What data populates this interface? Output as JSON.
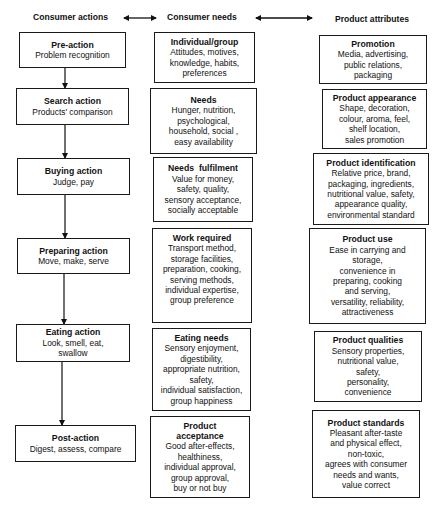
{
  "headers": {
    "consumer_actions": "Consumer actions",
    "consumer_needs": "Consumer needs",
    "product_attributes": "Product attributes"
  },
  "consumer_actions": [
    {
      "title": "Pre-action",
      "body": "Problem recognition"
    },
    {
      "title": "Search action",
      "body": "Products' comparison"
    },
    {
      "title": "Buying action",
      "body": "Judge, pay"
    },
    {
      "title": "Preparing action",
      "body": "Move, make, serve"
    },
    {
      "title": "Eating action",
      "body": "Look, smell, eat,\nswallow"
    },
    {
      "title": "Post-action",
      "body": "Digest, assess, compare"
    }
  ],
  "consumer_needs": [
    {
      "title": "Individual/group",
      "body": "Attitudes, motives,\nknowledge, habits,\npreferences"
    },
    {
      "title": "Needs",
      "body": "Hunger, nutrition,\npsychological,\nhousehold, social ,\neasy availability"
    },
    {
      "title": "Needs  fulfilment",
      "body": "Value for money,\nsafety, quality,\nsensory acceptance,\nsocially acceptable"
    },
    {
      "title": "Work required",
      "body": "Transport method,\nstorage facilities,\npreparation, cooking,\nserving methods,\nindividual expertise,\ngroup preference"
    },
    {
      "title": "Eating needs",
      "body": "Sensory enjoyment,\ndigestibility,\nappropriate nutrition,\nsafety,\nindividual satisfaction,\ngroup happiness"
    },
    {
      "title": "Product\nacceptance",
      "body": "Good after-effects,\nhealthiness,\nindividual approval,\ngroup approval,\nbuy or not buy"
    }
  ],
  "product_attributes": [
    {
      "title": "Promotion",
      "body": "Media, advertising,\npublic relations,\npackaging"
    },
    {
      "title": "Product appearance",
      "body": "Shape, decoration,\ncolour, aroma, feel,\nshelf location,\nsales promotion"
    },
    {
      "title": "Product identification",
      "body": "Relative price, brand,\npackaging, ingredients,\nnutritional value, safety,\nappearance quality,\nenvironmental standard"
    },
    {
      "title": "Product use",
      "body": "Ease in carrying and\nstorage,\nconvenience in\npreparing, cooking\nand serving,\nversatility, reliability,\nattractiveness"
    },
    {
      "title": "Product qualities",
      "body": "Sensory properties,\nnutritional value,\nsafety,\npersonality,\nconvenience"
    },
    {
      "title": "Product standards",
      "body": "Pleasant after-taste\nand physical effect,\nnon-toxic,\nagrees with consumer\nneeds and wants,\nvalue correct"
    }
  ]
}
